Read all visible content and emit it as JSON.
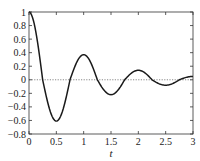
{
  "chart_data": {
    "type": "line",
    "title": "",
    "xlabel": "t",
    "ylabel": "",
    "xlim": [
      0,
      3
    ],
    "ylim": [
      -0.8,
      1
    ],
    "grid": false,
    "legend": null,
    "xticks": [
      0,
      0.5,
      1,
      1.5,
      2,
      2.5,
      3
    ],
    "xtick_labels": [
      "0",
      "0.5",
      "1",
      "1.5",
      "2",
      "2.5",
      "3"
    ],
    "yticks": [
      -0.8,
      -0.6,
      -0.4,
      -0.2,
      0,
      0.2,
      0.4,
      0.6,
      0.8,
      1
    ],
    "ytick_labels": [
      "−0.8",
      "−0.6",
      "−0.4",
      "−0.2",
      "0",
      "0.2",
      "0.4",
      "0.6",
      "0.8",
      "1"
    ],
    "series": [
      {
        "name": "damped oscillation",
        "style": "solid",
        "color": "#1a1a1a",
        "x": [
          0,
          0.25,
          0.5,
          0.75,
          1.0,
          1.25,
          1.5,
          1.75,
          2.0,
          2.25,
          2.5,
          2.75,
          3.0
        ],
        "y": [
          1.0,
          0.0,
          -0.61,
          0.0,
          0.37,
          0.0,
          -0.22,
          0.0,
          0.14,
          0.0,
          -0.08,
          0.0,
          0.05
        ]
      },
      {
        "name": "zero reference",
        "style": "dotted",
        "color": "#555555",
        "x": [
          0,
          3
        ],
        "y": [
          0,
          0
        ]
      }
    ],
    "annotations": []
  },
  "colors": {
    "curve": "#1a1a1a",
    "axis": "#333333",
    "reference": "#555555",
    "background": "#ffffff"
  }
}
